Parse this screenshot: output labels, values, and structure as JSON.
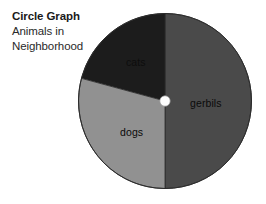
{
  "caption": {
    "title": "Circle Graph",
    "subtitle_line1": "Animals in",
    "subtitle_line2": "Neighborhood"
  },
  "labels": {
    "cats": "cats",
    "gerbils": "gerbils",
    "dogs": "dogs"
  },
  "colors": {
    "background": "#ffffff",
    "gerbils": "#4a4a4a",
    "cats": "#919191",
    "dogs": "#1c1c1c",
    "center_dot": "#fdfdfd",
    "outline": "#2b2b2b",
    "text": "#1a1a1a"
  },
  "chart_data": {
    "type": "pie",
    "title": "Circle Graph",
    "subtitle": "Animals in Neighborhood",
    "categories": [
      "gerbils",
      "cats",
      "dogs"
    ],
    "values": [
      50,
      29,
      21
    ],
    "value_unit": "percent",
    "start_angle_deg": 0,
    "direction": "clockwise",
    "slice_angles_deg": [
      180,
      105,
      75
    ],
    "colors": [
      "#4a4a4a",
      "#919191",
      "#1c1c1c"
    ],
    "labels_inside": true,
    "legend": "none",
    "grid": false,
    "center_marker": "white-dot"
  }
}
